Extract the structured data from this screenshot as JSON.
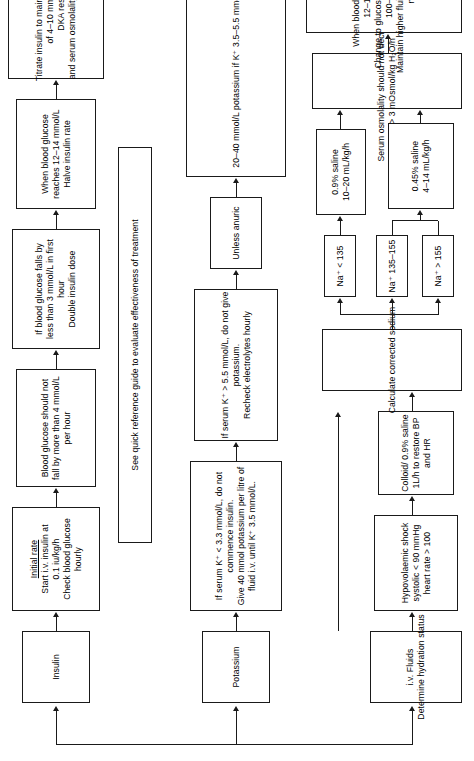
{
  "orientation": "rotated-90-ccw",
  "branches": {
    "fluids": {
      "header_line1": "i.v. Fluids",
      "header_line2": "Determine hydration status",
      "shock": {
        "l1": "Hypovolaemic shock",
        "l2": "systolic < 90 mmHg",
        "l3": "heart rate > 100"
      },
      "colloid": {
        "l1": "Colloid/ 0.9% saline",
        "l2": "1L/h to restore BP",
        "l3": "and HR"
      },
      "calc_sodium": "Calculate corrected sodium",
      "na_high": "Na⁺ > 155",
      "na_mid": "Na⁺ 135–155",
      "na_low": "Na⁺ < 135",
      "saline_045": {
        "l1": "0.45% saline",
        "l2": "4–14 mL/kg/h"
      },
      "saline_09": {
        "l1": "0.9% saline",
        "l2": "10–20 mL/kg/h"
      },
      "osmolality": {
        "l1": "Serum osmolality should not decrease by",
        "l2": "> 3 mOsmol/kg H₂O/h"
      },
      "glucose_switch": {
        "l1": "When blood glucose reaches",
        "l2": "12–14 mmol/L",
        "l3": "Change to glucose saline or 5% glucose",
        "l4": "100–125 mL/h",
        "l5": "Maintain higher fluid volume until lactate is",
        "l6": "normal"
      }
    },
    "potassium": {
      "header": "Potassium",
      "low_k": {
        "l1": "If serum K⁺ < 3.3 mmol/L, do not",
        "l2": "commence insulin.",
        "l3": "Give 40 mmol potassium per litre of",
        "l4": "fluid i.v. until K⁺ 3.5 mmol/L."
      },
      "high_k": {
        "l1": "If serum K⁺ > 5.5 mmol/L, do not give",
        "l2": "potassium.",
        "l3": "Recheck electrolytes hourly"
      },
      "anuric": "Unless anuric",
      "maintenance": "20–40 mmol/L potassium if K⁺ 3.5–5.5 mmol/L"
    },
    "insulin": {
      "header": "Insulin",
      "initial": {
        "title": "Initial rate",
        "l1": "Start i.v. insulin at",
        "l2": "0.1 iu/kg/h",
        "l3": "Check blood glucose",
        "l4": "hourly"
      },
      "fall_rate": {
        "l1": "Blood glucose should not",
        "l2": "fall by more than 4 mmol/L",
        "l3": "per hour"
      },
      "double_dose": {
        "l1": "If blood glucose falls by",
        "l2": "less than 3 mmol/L in first",
        "l3": "hour",
        "l4": "Double insulin dose"
      },
      "halve_rate": {
        "l1": "When blood glucose",
        "l2": "reaches 12–14 mmol/L",
        "l3": "Halve insulin rate"
      },
      "titrate": {
        "l1": "Titrate insulin to maintain blood glucose",
        "l2": "of 4–10 mmol/L until",
        "l3": "DKA resolved",
        "l4": "and serum osmolality < 320 mOsmol/L"
      }
    },
    "footer": {
      "quick_reference": "See quick reference guide to evaluate effectiveness of treatment"
    }
  },
  "colors": {
    "stroke": "#1a1a1a",
    "background": "#ffffff",
    "text": "#000000"
  }
}
